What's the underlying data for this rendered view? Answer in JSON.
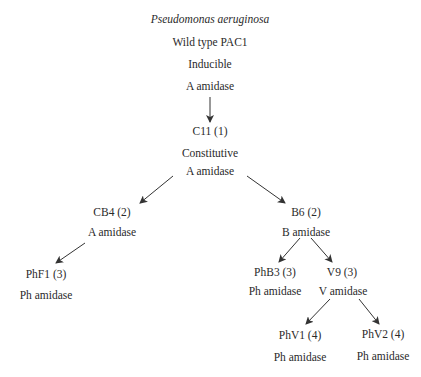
{
  "diagram": {
    "type": "lineage-tree",
    "root": {
      "species": "Pseudomonas aeruginosa",
      "strain": "Wild type PAC1",
      "regulation": "Inducible",
      "enzyme": "A amidase"
    },
    "nodes": {
      "c11": {
        "strain": "C11 (1)",
        "regulation": "Constitutive",
        "enzyme": "A amidase"
      },
      "cb4": {
        "strain": "CB4 (2)",
        "enzyme": "A amidase"
      },
      "b6": {
        "strain": "B6 (2)",
        "enzyme": "B amidase"
      },
      "phf1": {
        "strain": "PhF1 (3)",
        "enzyme": "Ph amidase"
      },
      "phb3": {
        "strain": "PhB3 (3)",
        "enzyme": "Ph amidase"
      },
      "v9": {
        "strain": "V9 (3)",
        "enzyme": "V amidase"
      },
      "phv1": {
        "strain": "PhV1 (4)",
        "enzyme": "Ph amidase"
      },
      "phv2": {
        "strain": "PhV2 (4)",
        "enzyme": "Ph amidase"
      }
    },
    "edges": [
      {
        "from": "root",
        "to": "c11"
      },
      {
        "from": "c11",
        "to": "cb4"
      },
      {
        "from": "c11",
        "to": "b6"
      },
      {
        "from": "cb4",
        "to": "phf1"
      },
      {
        "from": "b6",
        "to": "phb3"
      },
      {
        "from": "b6",
        "to": "v9"
      },
      {
        "from": "v9",
        "to": "phv1"
      },
      {
        "from": "v9",
        "to": "phv2"
      }
    ],
    "colors": {
      "text": "#2a2a2a",
      "arrow": "#333333",
      "background": "#ffffff"
    }
  }
}
